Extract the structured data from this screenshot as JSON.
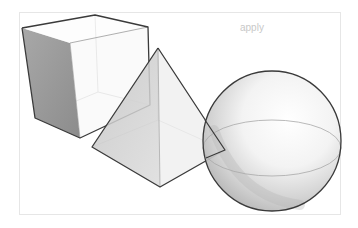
{
  "figure": {
    "shapes": [
      {
        "name": "cube",
        "type": "cube"
      },
      {
        "name": "pyramid",
        "type": "square-pyramid"
      },
      {
        "name": "sphere",
        "type": "sphere"
      }
    ],
    "colors": {
      "background": "#ffffff",
      "outline": "#3a3a3a",
      "hidden_edge": "#bdbdbd",
      "cube_side_face": "#9a9a9a",
      "pyramid_face": "#cfcfcf",
      "sphere_shade": "#b8b8b8",
      "frame_border": "#e6e6e6"
    }
  },
  "bleed_text": {
    "line1": "apply"
  }
}
